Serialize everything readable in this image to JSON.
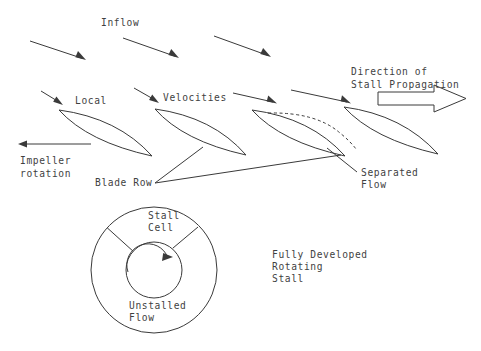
{
  "figure": {
    "title_text_present": false,
    "background_color": "#ffffff",
    "line_color": "#3a3a3a",
    "text_color": "#3f3f3f",
    "labels": {
      "inflow": "Inflow",
      "local": "Local",
      "velocities": "Velocities",
      "direction_of": "Direction of",
      "stall_propagation": "Stall Propagation",
      "impeller": "Impeller",
      "rotation": "rotation",
      "blade_row": "Blade Row",
      "separated": "Separated",
      "flow": "Flow",
      "stall": "Stall",
      "cell": "Cell",
      "unstalled": "Unstalled",
      "flow2": "Flow",
      "fully_developed": "Fully Developed",
      "rotating": "Rotating",
      "stall2": "Stall"
    },
    "label_positions": {
      "inflow": {
        "x": 101,
        "y": 26
      },
      "local": {
        "x": 75,
        "y": 104
      },
      "velocities": {
        "x": 163,
        "y": 101
      },
      "direction_of": {
        "x": 351,
        "y": 75
      },
      "stall_propagation": {
        "x": 351,
        "y": 88
      },
      "impeller": {
        "x": 20,
        "y": 164
      },
      "rotation": {
        "x": 20,
        "y": 177
      },
      "blade_row": {
        "x": 95,
        "y": 186
      },
      "separated": {
        "x": 361,
        "y": 176
      },
      "flow": {
        "x": 361,
        "y": 188
      },
      "stall": {
        "x": 148,
        "y": 219
      },
      "cell": {
        "x": 148,
        "y": 231
      },
      "unstalled": {
        "x": 129,
        "y": 309
      },
      "flow2": {
        "x": 129,
        "y": 321
      },
      "fully_developed": {
        "x": 272,
        "y": 258
      },
      "rotating": {
        "x": 272,
        "y": 270
      },
      "stall2": {
        "x": 272,
        "y": 282
      }
    },
    "inflow_arrows": [
      {
        "name": "inflow-arrow-1",
        "x1": 30,
        "y1": 41,
        "x2": 86,
        "y2": 60
      },
      {
        "name": "inflow-arrow-2",
        "x1": 123,
        "y1": 38,
        "x2": 179,
        "y2": 58
      },
      {
        "name": "inflow-arrow-3",
        "x1": 214,
        "y1": 36,
        "x2": 271,
        "y2": 57
      }
    ],
    "velocity_arrows": [
      {
        "name": "velocity-arrow-1",
        "x1": 41,
        "y1": 91,
        "x2": 62,
        "y2": 104
      },
      {
        "name": "velocity-arrow-2",
        "x1": 134,
        "y1": 88,
        "x2": 158,
        "y2": 102
      },
      {
        "name": "velocity-arrow-3",
        "x1": 233,
        "y1": 93,
        "x2": 276,
        "y2": 103
      },
      {
        "name": "velocity-arrow-4",
        "x1": 291,
        "y1": 90,
        "x2": 350,
        "y2": 103
      }
    ],
    "impeller_arrow": {
      "x1": 91,
      "y1": 144,
      "x2": 19,
      "y2": 144
    },
    "blades": [
      {
        "name": "blade-1",
        "x1": 59,
        "y1": 110,
        "x2": 152,
        "y2": 156,
        "bow": 13
      },
      {
        "name": "blade-2",
        "x1": 155,
        "y1": 109,
        "x2": 246,
        "y2": 155,
        "bow": 13
      },
      {
        "name": "blade-3",
        "x1": 252,
        "y1": 110,
        "x2": 345,
        "y2": 156,
        "bow": 13
      },
      {
        "name": "blade-4",
        "x1": 344,
        "y1": 107,
        "x2": 438,
        "y2": 154,
        "bow": 13
      }
    ],
    "separated_flow_dashed": {
      "x1": 268,
      "y1": 113,
      "cx": 318,
      "cy": 118,
      "x2": 355,
      "y2": 148
    },
    "leader_lines": [
      {
        "name": "blade-row-leader-upper",
        "x1": 155,
        "y1": 183,
        "x2": 203,
        "y2": 147
      },
      {
        "name": "blade-row-leader-right",
        "x1": 155,
        "y1": 183,
        "x2": 341,
        "y2": 155
      },
      {
        "name": "separated-flow-leader",
        "x1": 357,
        "y1": 172,
        "x2": 327,
        "y2": 148
      }
    ],
    "block_arrow": {
      "name": "stall-propagation-block-arrow",
      "body_left": 378,
      "body_right": 434,
      "body_top": 92,
      "body_bottom": 105,
      "head_tip_x": 466,
      "head_top": 85,
      "head_bottom": 112
    },
    "annulus": {
      "center_x": 154,
      "center_y": 270,
      "outer_radius": 63,
      "inner_radius": 28,
      "sector_line_1": {
        "angle_deg": 222
      },
      "sector_line_2": {
        "angle_deg": 312
      },
      "rotation_arc_label": "clockwise"
    }
  }
}
